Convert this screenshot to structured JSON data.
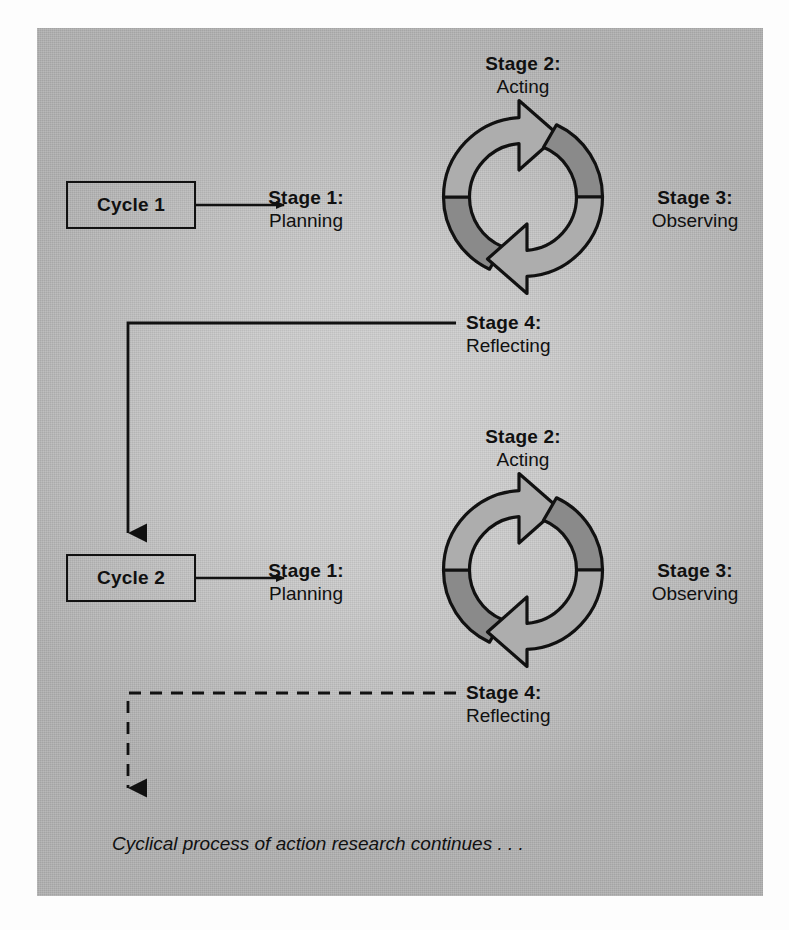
{
  "figure": {
    "title_caption": "Cyclical process of action research continues . . .",
    "panel_background": "#c9c9c9",
    "line_color": "#111111",
    "arrow_light_fill": "#adadad",
    "arrow_dark_fill": "#8a8a8a"
  },
  "cycles": [
    {
      "box_label": "Cycle 1",
      "stages": [
        {
          "id": "stage-1",
          "number": "Stage 1:",
          "name": "Planning"
        },
        {
          "id": "stage-2",
          "number": "Stage 2:",
          "name": "Acting"
        },
        {
          "id": "stage-3",
          "number": "Stage 3:",
          "name": "Observing"
        },
        {
          "id": "stage-4",
          "number": "Stage 4:",
          "name": "Reflecting"
        }
      ],
      "connector_style": "solid"
    },
    {
      "box_label": "Cycle 2",
      "stages": [
        {
          "id": "stage-1",
          "number": "Stage 1:",
          "name": "Planning"
        },
        {
          "id": "stage-2",
          "number": "Stage 2:",
          "name": "Acting"
        },
        {
          "id": "stage-3",
          "number": "Stage 3:",
          "name": "Observing"
        },
        {
          "id": "stage-4",
          "number": "Stage 4:",
          "name": "Reflecting"
        }
      ],
      "connector_style": "dashed"
    }
  ],
  "icons": {
    "cycle_arrows": "circular-arrows-icon",
    "flow_arrow": "arrow-right-icon",
    "down_arrow": "arrow-down-icon"
  }
}
